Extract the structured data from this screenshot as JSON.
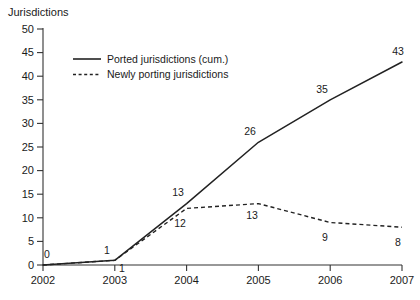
{
  "chart_data": {
    "type": "line",
    "title": "",
    "ylabel": "Jurisdictions",
    "xlabel": "",
    "categories": [
      "2002",
      "2003",
      "2004",
      "2005",
      "2006",
      "2007"
    ],
    "x": [
      2002,
      2003,
      2004,
      2005,
      2006,
      2007
    ],
    "ylim": [
      0,
      50
    ],
    "yticks": [
      "0",
      "5",
      "10",
      "15",
      "20",
      "25",
      "30",
      "35",
      "40",
      "45",
      "50"
    ],
    "grid": false,
    "legend_position": "upper-left-inside",
    "series": [
      {
        "name": "Ported jurisdictions (cum.)",
        "style": "solid",
        "values": [
          0,
          1,
          13,
          26,
          35,
          43
        ],
        "point_labels": [
          "0",
          "1",
          "13",
          "26",
          "35",
          "43"
        ]
      },
      {
        "name": "Newly porting jurisdictions",
        "style": "dashed",
        "values": [
          0,
          1,
          12,
          13,
          9,
          8
        ],
        "point_labels": [
          "",
          "1",
          "12",
          "13",
          "9",
          "8"
        ]
      }
    ],
    "colors": {
      "series_line": "#222222",
      "axis": "#333333",
      "background": "#ffffff",
      "text": "#1a1a1a"
    }
  },
  "axis": {
    "y_title": "Jurisdictions",
    "y_labels": [
      "50",
      "45",
      "40",
      "35",
      "30",
      "25",
      "20",
      "15",
      "10",
      "5",
      "0"
    ],
    "x_labels": [
      "2002",
      "2003",
      "2004",
      "2005",
      "2006",
      "2007"
    ]
  },
  "legend": {
    "items": [
      {
        "label": "Ported jurisdictions (cum.)",
        "style": "solid"
      },
      {
        "label": "Newly porting jurisdictions",
        "style": "dashed"
      }
    ]
  },
  "labels": {
    "cum_2002": "0",
    "cum_2003": "1",
    "cum_2004": "13",
    "cum_2005": "26",
    "cum_2006": "35",
    "cum_2007": "43",
    "new_2003": "1",
    "new_2004": "12",
    "new_2005": "13",
    "new_2006": "9",
    "new_2007": "8"
  }
}
